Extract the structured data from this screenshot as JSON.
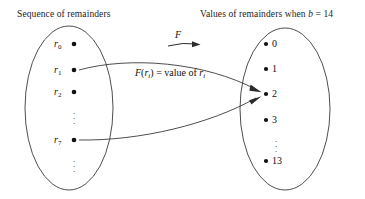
{
  "figure": {
    "type": "mapping-diagram",
    "titles": {
      "left": "Sequence of remainders",
      "right_prefix": "Values of remainders when ",
      "right_var": "b",
      "right_suffix": " = 14"
    },
    "function_arrow_label": "F",
    "function_caption": {
      "f": "F",
      "open": "(",
      "arg_base": "r",
      "arg_sub": "i",
      "close": ")",
      "equals": " = value of ",
      "value_base": "r",
      "value_sub": "i",
      "full": "F(r_i) = value of r_i"
    },
    "left_set": {
      "items": [
        {
          "base": "r",
          "sub": "0",
          "dot": "•"
        },
        {
          "base": "r",
          "sub": "1",
          "dot": "•"
        },
        {
          "base": "r",
          "sub": "2",
          "dot": "•"
        },
        {
          "base": "r",
          "sub": "7",
          "dot": "•"
        }
      ],
      "ellipsis": "⋮"
    },
    "right_set": {
      "items": [
        "0",
        "1",
        "2",
        "3",
        "13"
      ],
      "dot": "•",
      "ellipsis": "⋮"
    },
    "mappings": [
      {
        "from": "r_1",
        "to": "2"
      },
      {
        "from": "r_7",
        "to": "2"
      }
    ],
    "colors": {
      "stroke": "#2b2b2b",
      "text": "#101010",
      "background": "#ffffff"
    }
  }
}
